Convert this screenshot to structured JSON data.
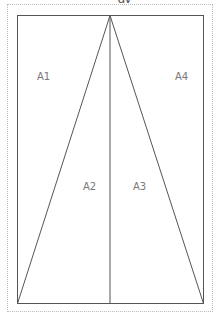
{
  "title": {
    "text": "gy",
    "clipped": true
  },
  "diagram": {
    "regions": [
      {
        "id": "A1",
        "label": "A1",
        "x": 37,
        "y": 80
      },
      {
        "id": "A4",
        "label": "A4",
        "x": 175,
        "y": 80
      },
      {
        "id": "A2",
        "label": "A2",
        "x": 83,
        "y": 190
      },
      {
        "id": "A3",
        "label": "A3",
        "x": 133,
        "y": 190
      }
    ],
    "colors": {
      "line": "#555555",
      "border": "#bbbbbb",
      "label": "#777777"
    }
  }
}
